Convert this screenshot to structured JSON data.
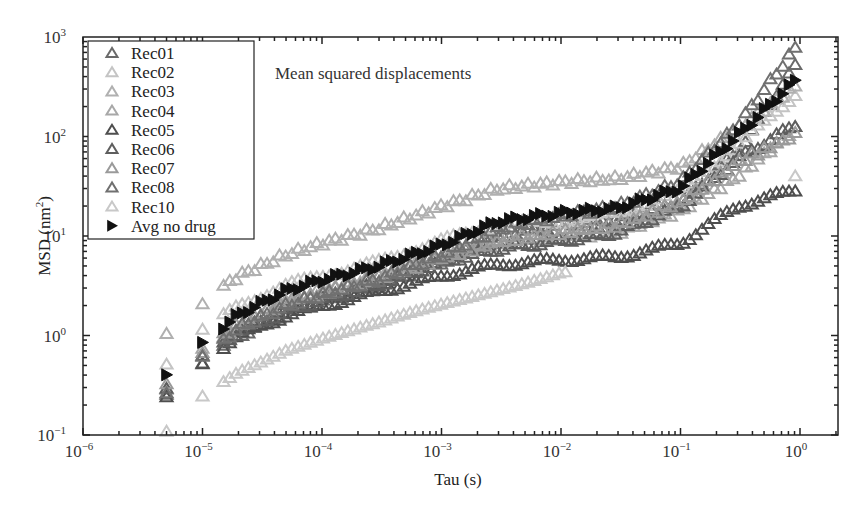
{
  "chart_data": {
    "type": "scatter",
    "title": "",
    "annotation": "Mean squared displacements",
    "xlabel": "Tau (s)",
    "ylabel": "MSD (nm²)",
    "xscale": "log",
    "yscale": "log",
    "xlim": [
      1e-06,
      1.5
    ],
    "ylim": [
      0.1,
      1000
    ],
    "xticks": [
      {
        "base": "10",
        "exp": "−6",
        "value": -6
      },
      {
        "base": "10",
        "exp": "−5",
        "value": -5
      },
      {
        "base": "10",
        "exp": "−4",
        "value": -4
      },
      {
        "base": "10",
        "exp": "−3",
        "value": -3
      },
      {
        "base": "10",
        "exp": "−2",
        "value": -2
      },
      {
        "base": "10",
        "exp": "−1",
        "value": -1
      },
      {
        "base": "10",
        "exp": "0",
        "value": 0
      }
    ],
    "yticks": [
      {
        "base": "10",
        "exp": "−1",
        "value": -1
      },
      {
        "base": "10",
        "exp": "0",
        "value": 0
      },
      {
        "base": "10",
        "exp": "1",
        "value": 1
      },
      {
        "base": "10",
        "exp": "2",
        "value": 2
      },
      {
        "base": "10",
        "exp": "3",
        "value": 3
      }
    ],
    "grid": false,
    "legend_position": "upper-left",
    "x_tau_s": [
      5e-06,
      1e-05,
      2e-05,
      5e-05,
      0.0001,
      0.0003,
      0.001,
      0.003,
      0.01,
      0.03,
      0.1,
      0.3,
      1.0
    ],
    "series": [
      {
        "name": "Rec01",
        "marker": "open-triangle",
        "color": "#6a6a6a",
        "values": [
          0.27,
          0.55,
          1.0,
          1.7,
          2.2,
          3.2,
          5.5,
          10,
          13,
          15,
          22,
          70,
          600
        ]
      },
      {
        "name": "Rec02",
        "marker": "open-triangle",
        "color": "#c4c4c4",
        "values": [
          0.5,
          1.1,
          2.0,
          3.2,
          4.0,
          5.5,
          9.0,
          13,
          14,
          17,
          28,
          80,
          300
        ]
      },
      {
        "name": "Rec03",
        "marker": "open-triangle",
        "color": "#b0b0b0",
        "values": [
          1.0,
          2.2,
          4.0,
          6.5,
          8.5,
          12,
          20,
          30,
          35,
          38,
          50,
          120,
          350
        ]
      },
      {
        "name": "Rec04",
        "marker": "open-triangle",
        "color": "#a8a8a8",
        "values": [
          0.3,
          0.7,
          1.3,
          2.2,
          2.8,
          4.0,
          6.5,
          8.5,
          9.5,
          11,
          18,
          40,
          130
        ]
      },
      {
        "name": "Rec05",
        "marker": "open-triangle",
        "color": "#4e4e4e",
        "values": [
          0.25,
          0.55,
          1.0,
          1.6,
          2.0,
          2.8,
          4.0,
          5.2,
          5.8,
          6.2,
          8.5,
          20,
          30
        ]
      },
      {
        "name": "Rec06",
        "marker": "open-triangle",
        "color": "#5e5e5e",
        "values": [
          0.28,
          0.6,
          1.1,
          1.8,
          2.3,
          3.3,
          5.5,
          7.5,
          9.0,
          11,
          20,
          60,
          140
        ]
      },
      {
        "name": "Rec07",
        "marker": "open-triangle",
        "color": "#9a9a9a",
        "values": [
          0.32,
          0.7,
          1.3,
          2.2,
          2.7,
          3.8,
          6.0,
          9.0,
          11,
          13,
          22,
          55,
          110
        ]
      },
      {
        "name": "Rec08",
        "marker": "open-triangle",
        "color": "#707070",
        "values": [
          0.28,
          0.6,
          1.2,
          2.0,
          2.6,
          3.7,
          6.5,
          12,
          16,
          20,
          35,
          130,
          900
        ]
      },
      {
        "name": "Rec10",
        "marker": "open-triangle",
        "color": "#c8c8c8",
        "values": [
          0.11,
          0.25,
          0.45,
          0.75,
          0.95,
          1.3,
          2.0,
          3.0,
          4.5,
          5.0,
          null,
          null,
          45
        ]
      },
      {
        "name": "Avg no drug",
        "marker": "filled-right-triangle",
        "color": "#111111",
        "values": [
          0.38,
          0.85,
          1.6,
          2.8,
          3.6,
          5.0,
          8.0,
          14,
          17,
          19,
          30,
          100,
          400
        ]
      }
    ]
  }
}
